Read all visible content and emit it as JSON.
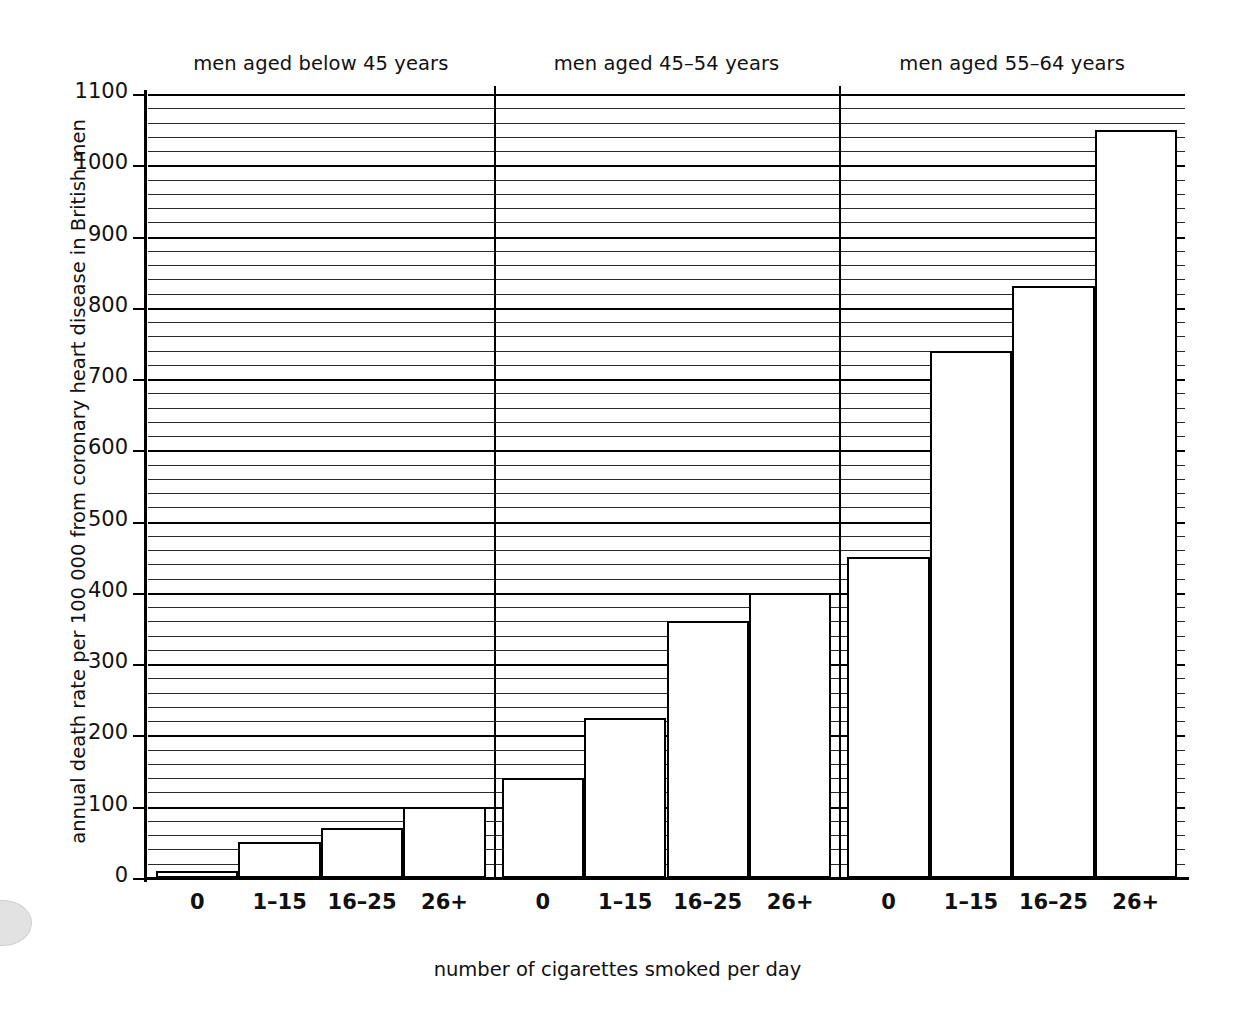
{
  "chart_data": {
    "type": "bar",
    "title": "",
    "xlabel": "number of cigarettes smoked per day",
    "ylabel": "annual death rate per 100 000 from coronary heart disease in British men",
    "ylim": [
      0,
      1100
    ],
    "ytick_labels": [
      "0",
      "100",
      "200",
      "300",
      "400",
      "500",
      "600",
      "700",
      "800",
      "900",
      "1000",
      "1100"
    ],
    "ytick_values": [
      0,
      100,
      200,
      300,
      400,
      500,
      600,
      700,
      800,
      900,
      1000,
      1100
    ],
    "grid": "horizontal minor gridlines every 20 units, major every 100",
    "legend": "none",
    "categories": [
      "0",
      "1–15",
      "16–25",
      "26+"
    ],
    "panels": [
      {
        "label": "men aged below 45 years",
        "categories": [
          "0",
          "1–15",
          "16–25",
          "26+"
        ],
        "values": [
          10,
          50,
          70,
          100
        ]
      },
      {
        "label": "men aged 45–54 years",
        "categories": [
          "0",
          "1–15",
          "16–25",
          "26+"
        ],
        "values": [
          140,
          225,
          360,
          400
        ]
      },
      {
        "label": "men aged 55–64 years",
        "categories": [
          "0",
          "1–15",
          "16–25",
          "26+"
        ],
        "values": [
          450,
          740,
          830,
          1050
        ]
      }
    ],
    "series": [
      {
        "name": "men aged below 45 years",
        "values": [
          10,
          50,
          70,
          100
        ]
      },
      {
        "name": "men aged 45–54 years",
        "values": [
          140,
          225,
          360,
          400
        ]
      },
      {
        "name": "men aged 55–64 years",
        "values": [
          450,
          740,
          830,
          1050
        ]
      }
    ],
    "colors": {
      "bar_fill": "#ffffff",
      "bar_edge": "#000000",
      "gridline": "#2b2b2b",
      "axis": "#000000",
      "text": "#111111"
    }
  }
}
